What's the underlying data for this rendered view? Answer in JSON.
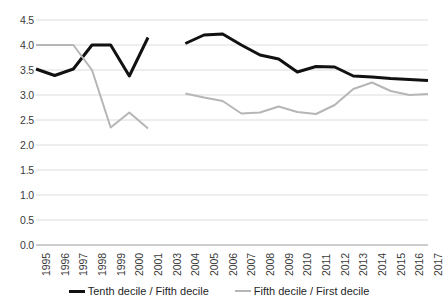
{
  "chart_data": {
    "type": "line",
    "title": "",
    "subtitle": "",
    "xlabel": "",
    "ylabel": "",
    "ylim": [
      0.0,
      4.5
    ],
    "ytick_step": 0.5,
    "ytick_labels": [
      "4.5",
      "4.0",
      "3.5",
      "3.0",
      "2.5",
      "2.0",
      "1.5",
      "1.0",
      "0.5",
      "0.0"
    ],
    "ytick_values": [
      4.5,
      4.0,
      3.5,
      3.0,
      2.5,
      2.0,
      1.5,
      1.0,
      0.5,
      0.0
    ],
    "grid": "horizontal",
    "legend_position": "bottom",
    "categories": [
      "1995",
      "1996",
      "1997",
      "1998",
      "1999",
      "2000",
      "2001",
      "2003",
      "2004",
      "2005",
      "2006",
      "2007",
      "2008",
      "2009",
      "2010",
      "2011",
      "2012",
      "2013",
      "2014",
      "2015",
      "2016",
      "2017"
    ],
    "note_missing_category": "2002",
    "series": [
      {
        "name": "Tenth decile / Fifth decile",
        "color": "#111111",
        "width": 3,
        "values": [
          3.52,
          3.39,
          3.52,
          4.0,
          4.0,
          3.38,
          4.15,
          null,
          4.03,
          4.2,
          4.22,
          4.0,
          3.8,
          3.72,
          3.46,
          3.57,
          3.56,
          3.38,
          3.36,
          3.33,
          3.31,
          3.29
        ]
      },
      {
        "name": "Fifth decile / First decile",
        "color": "#b6b6b6",
        "width": 2,
        "values": [
          4.0,
          4.0,
          4.0,
          3.5,
          2.35,
          2.65,
          2.33,
          null,
          3.03,
          2.95,
          2.88,
          2.63,
          2.65,
          2.77,
          2.66,
          2.62,
          2.8,
          3.12,
          3.25,
          3.08,
          3.0,
          3.02
        ]
      }
    ]
  },
  "legend": {
    "items": [
      {
        "label": "Tenth decile / Fifth decile"
      },
      {
        "label": "Fifth decile / First decile"
      }
    ]
  }
}
